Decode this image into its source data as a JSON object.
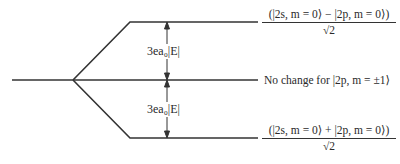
{
  "diagram": {
    "upper_state": {
      "numerator": "(|2s, m = 0⟩ − |2p, m = 0⟩)",
      "denominator": "√2"
    },
    "middle_state": {
      "label": "No change for  |2p, m = ±1⟩"
    },
    "lower_state": {
      "numerator": "(|2s, m = 0⟩ + |2p, m = 0⟩)",
      "denominator": "√2"
    },
    "upper_shift": "3ea₀|E|",
    "lower_shift": "3ea₀|E|"
  }
}
